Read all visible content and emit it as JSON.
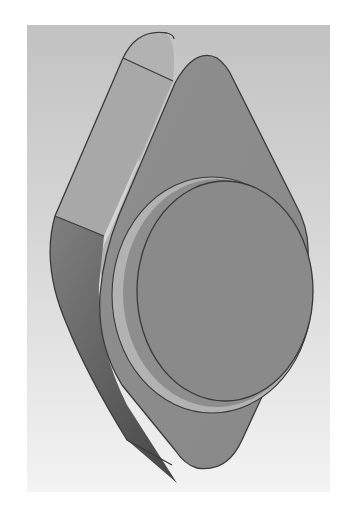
{
  "image": {
    "subject": "3D rendered mechanical part: rounded diamond-shaped flange with circular raised boss",
    "style": "grayscale CAD shaded render",
    "colors": {
      "page_background": "#ffffff",
      "backdrop_top": "#c2c2c2",
      "backdrop_bottom": "#f3f3f3",
      "flange_face": "#8c8c8c",
      "boss_face": "#8a8a8a",
      "side_light": "#a6a6a6",
      "side_dark": "#5a5a5a",
      "ring": "#b0b0b0",
      "outline": "#3a3a3a"
    }
  }
}
